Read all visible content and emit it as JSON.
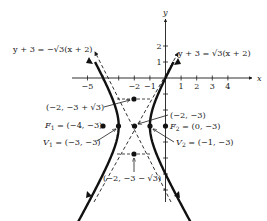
{
  "figure": {
    "type": "hyperbola-graph",
    "equation_description": "Hyperbola (x+2)^2 - (y+3)^2/3 = 1 with center (-2,-3), horizontal transverse axis",
    "colors": {
      "ink": "#1a1a1a",
      "background": "#ffffff"
    }
  },
  "axes": {
    "x_label": "x",
    "y_label": "y",
    "x_ticks": [
      {
        "value": -5,
        "label": "−5"
      },
      {
        "value": -4,
        "label": ""
      },
      {
        "value": -3,
        "label": ""
      },
      {
        "value": -2,
        "label": "−2"
      },
      {
        "value": -1,
        "label": "−1"
      },
      {
        "value": 1,
        "label": "1"
      },
      {
        "value": 2,
        "label": "2"
      },
      {
        "value": 3,
        "label": "3"
      },
      {
        "value": 4,
        "label": "4"
      }
    ],
    "y_ticks": [
      {
        "value": 2,
        "label": "2"
      },
      {
        "value": 1,
        "label": "1"
      },
      {
        "value": -1,
        "label": ""
      },
      {
        "value": -2,
        "label": ""
      },
      {
        "value": -3,
        "label": ""
      },
      {
        "value": -4,
        "label": ""
      },
      {
        "value": -5,
        "label": ""
      },
      {
        "value": -6,
        "label": ""
      },
      {
        "value": -7,
        "label": ""
      }
    ]
  },
  "asymptotes": [
    {
      "id": "neg",
      "label": "y + 3 = −√3(x + 2)",
      "slope": "-sqrt3"
    },
    {
      "id": "pos",
      "label": "y + 3 = √3(x + 2)",
      "slope": "sqrt3"
    }
  ],
  "points": {
    "center": {
      "label": "(−2, −3)",
      "x": -2,
      "y": -3
    },
    "top": {
      "label": "(−2, −3 + √3)",
      "x": -2,
      "y": "-3+sqrt3"
    },
    "bottom": {
      "label": "(−2, −3 − √3)",
      "x": -2,
      "y": "-3-sqrt3"
    },
    "f1": {
      "name": "F",
      "sub": "1",
      "label": " = (−4, −3)",
      "x": -4,
      "y": -3
    },
    "f2": {
      "name": "F",
      "sub": "2",
      "label": " = (0, −3)",
      "x": 0,
      "y": -3
    },
    "v1": {
      "name": "V",
      "sub": "1",
      "label": " = (−3, −3)",
      "x": -3,
      "y": -3
    },
    "v2": {
      "name": "V",
      "sub": "2",
      "label": " = (−1, −3)",
      "x": -1,
      "y": -3
    }
  }
}
